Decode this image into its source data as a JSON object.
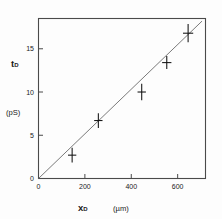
{
  "figure": {
    "background": "#fdfdfd",
    "frame_color": "#4a4a4a",
    "marker_color": "#111111",
    "fit_color": "#6b6b6b"
  },
  "axes": {
    "y_name": "t",
    "y_subscript": "D",
    "y_unit": "(pS)",
    "x_name": "x",
    "x_subscript": "D",
    "x_unit": "(µm)"
  },
  "chart_data": {
    "type": "scatter",
    "title": "",
    "xlabel": "x_D",
    "ylabel": "t_D",
    "xunit": "µm",
    "yunit": "pS",
    "xlim": [
      0,
      720
    ],
    "ylim": [
      0,
      18.5
    ],
    "grid": false,
    "legend": null,
    "xticks": [
      0,
      200,
      400,
      600
    ],
    "xtick_labels": [
      "0",
      "200",
      "400",
      "600"
    ],
    "yticks": [
      0,
      5,
      10,
      15
    ],
    "ytick_labels": [
      "0",
      "5",
      "10",
      "15"
    ],
    "points": [
      {
        "x": 145,
        "y": 2.7,
        "xerr": 18,
        "yerr": 0.85
      },
      {
        "x": 258,
        "y": 6.7,
        "xerr": 18,
        "yerr": 0.85
      },
      {
        "x": 445,
        "y": 10.0,
        "xerr": 18,
        "yerr": 0.95
      },
      {
        "x": 553,
        "y": 13.4,
        "xerr": 20,
        "yerr": 0.75
      },
      {
        "x": 645,
        "y": 16.8,
        "xerr": 22,
        "yerr": 1.05
      }
    ],
    "fit_line": {
      "x0": 0,
      "y0": 0,
      "x1": 705,
      "y1": 18.2,
      "through_origin": true
    }
  }
}
